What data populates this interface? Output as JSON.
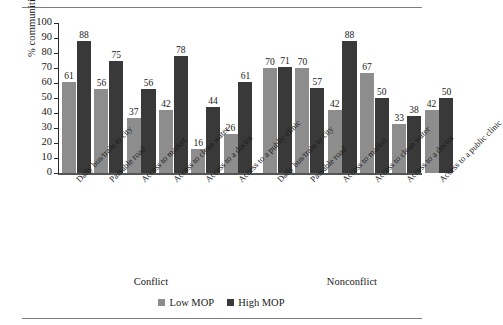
{
  "chart_data": {
    "type": "bar",
    "title": "",
    "xlabel": "",
    "ylabel": "% communities",
    "ylim": [
      0,
      100
    ],
    "ytick_step": 10,
    "yticks": [
      100,
      90,
      80,
      70,
      60,
      50,
      40,
      30,
      20,
      10,
      0
    ],
    "grid": false,
    "legend_position": "bottom-center",
    "legend": [
      "Low MOP",
      "High MOP"
    ],
    "colors": {
      "low_mop": "#8d8d8d",
      "high_mop": "#393939"
    },
    "categories": [
      "Daily bus/train to city",
      "Passable road",
      "Access to market",
      "Access to clean water",
      "Access to a doctor",
      "Access to a public clinic"
    ],
    "panels": [
      {
        "name": "Conflict",
        "series": [
          {
            "name": "Low MOP",
            "values": [
              61,
              56,
              37,
              42,
              16,
              26
            ]
          },
          {
            "name": "High MOP",
            "values": [
              88,
              75,
              56,
              78,
              44,
              61
            ]
          }
        ]
      },
      {
        "name": "Nonconflict",
        "series": [
          {
            "name": "Low MOP",
            "values": [
              70,
              70,
              42,
              67,
              33,
              42
            ]
          },
          {
            "name": "High MOP",
            "values": [
              71,
              57,
              88,
              50,
              38,
              50
            ]
          }
        ]
      }
    ]
  }
}
